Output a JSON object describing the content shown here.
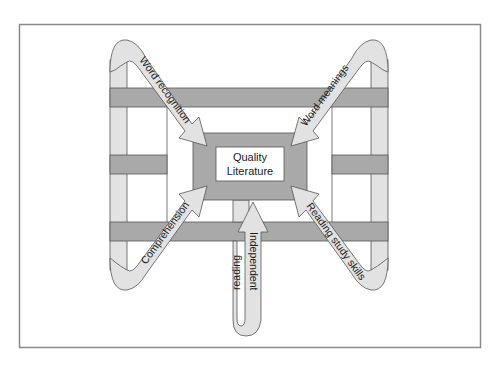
{
  "diagram": {
    "center": {
      "line1": "Quality",
      "line2": "Literature"
    },
    "arrows": [
      {
        "id": "word-recognition",
        "label": "Word recognition",
        "direction": "from top-left into center"
      },
      {
        "id": "word-meanings",
        "label": "Word meanings",
        "direction": "from top-right into center"
      },
      {
        "id": "comprehension",
        "label": "Comprehension",
        "direction": "from bottom-left into center"
      },
      {
        "id": "reading-study-skills",
        "label": "Reading study skills",
        "direction": "from bottom-right into center"
      },
      {
        "id": "independent-reading",
        "label_line1": "Independent",
        "label_line2": "reading",
        "direction": "from bottom up into center"
      }
    ],
    "colors": {
      "frame": "#8a8a8a",
      "bar_dark": "#a9a9a9",
      "arrow_light": "#e2e2e2",
      "outline": "#555555",
      "label_box": "#ffffff"
    }
  }
}
